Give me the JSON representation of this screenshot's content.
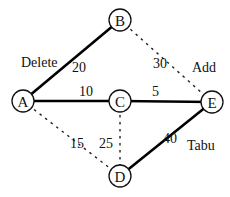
{
  "nodes": [
    {
      "id": "A",
      "label": "A"
    },
    {
      "id": "B",
      "label": "B"
    },
    {
      "id": "C",
      "label": "C"
    },
    {
      "id": "D",
      "label": "D"
    },
    {
      "id": "E",
      "label": "E"
    }
  ],
  "edges": [
    {
      "from": "A",
      "to": "B",
      "weight": "20",
      "style": "solid",
      "annotation": "Delete"
    },
    {
      "from": "A",
      "to": "C",
      "weight": "10",
      "style": "solid",
      "annotation": ""
    },
    {
      "from": "C",
      "to": "E",
      "weight": "5",
      "style": "solid",
      "annotation": ""
    },
    {
      "from": "D",
      "to": "E",
      "weight": "40",
      "style": "solid",
      "annotation": "Tabu"
    },
    {
      "from": "B",
      "to": "E",
      "weight": "30",
      "style": "dotted",
      "annotation": "Add"
    },
    {
      "from": "A",
      "to": "D",
      "weight": "15",
      "style": "dotted",
      "annotation": ""
    },
    {
      "from": "C",
      "to": "D",
      "weight": "25",
      "style": "dotted",
      "annotation": ""
    }
  ],
  "annotations": {
    "delete": "Delete",
    "add": "Add",
    "tabu": "Tabu"
  }
}
